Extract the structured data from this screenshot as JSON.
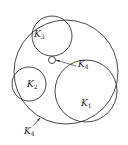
{
  "diagram": {
    "type": "tangent-circles",
    "circles": [
      {
        "id": "outer",
        "label": "K",
        "sub": "4",
        "cx": 66,
        "cy": 72,
        "r": 52
      },
      {
        "id": "k1",
        "label": "K",
        "sub": "1",
        "cx": 86,
        "cy": 91,
        "r": 31
      },
      {
        "id": "k2",
        "label": "K",
        "sub": "2",
        "cx": 29,
        "cy": 84,
        "r": 17
      },
      {
        "id": "k3",
        "label": "K",
        "sub": "3",
        "cx": 52,
        "cy": 36,
        "r": 20
      },
      {
        "id": "small",
        "label": "K",
        "sub": "4",
        "cx": 52,
        "cy": 60,
        "r": 3.5
      }
    ],
    "labels": {
      "k1": {
        "text": "K",
        "sub": "1"
      },
      "k2": {
        "text": "K",
        "sub": "2"
      },
      "k3": {
        "text": "K",
        "sub": "3"
      },
      "small": {
        "text": "K",
        "sub": "4"
      },
      "outer": {
        "text": "K",
        "sub": "4"
      }
    }
  }
}
